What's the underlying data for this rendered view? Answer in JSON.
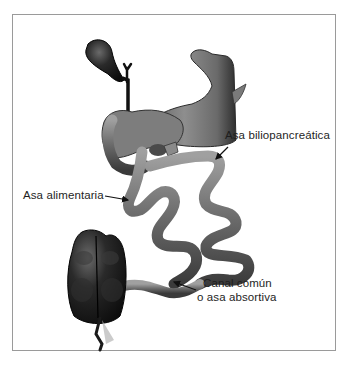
{
  "figure": {
    "labels": {
      "biliopancreatic_limb": "Asa biliopancreática",
      "alimentary_limb": "Asa alimentaria",
      "common_channel_line1": "Canal común",
      "common_channel_line2": "o asa absortiva"
    },
    "structures": [
      "gallbladder",
      "bile-duct",
      "stomach",
      "duodenum",
      "pancreas",
      "biliopancreatic-limb",
      "alimentary-limb",
      "common-channel",
      "cecum",
      "appendix"
    ],
    "colors": {
      "border": "#9a9a9a",
      "text": "#1e1e1e",
      "organ_dark": "#1a1a1a",
      "intestine_mid": "#6e6e6e",
      "intestine_light": "#a8a8a8",
      "background": "#ffffff"
    }
  }
}
